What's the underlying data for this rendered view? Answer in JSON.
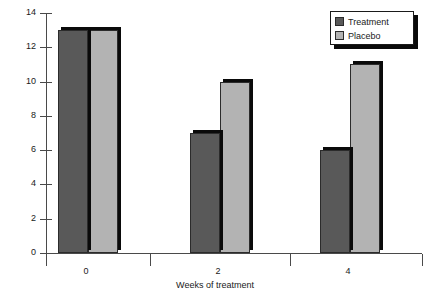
{
  "chart_data": {
    "type": "bar",
    "title": "",
    "subtitle": "",
    "xlabel": "Weeks of treatment",
    "ylabel": "",
    "categories": [
      "0",
      "2",
      "4"
    ],
    "series": [
      {
        "name": "Treatment",
        "values": [
          13,
          7,
          6
        ],
        "color": "#595959"
      },
      {
        "name": "Placebo",
        "values": [
          13,
          10,
          11
        ],
        "color": "#b3b3b3"
      }
    ],
    "ylim": [
      0,
      14
    ],
    "ytick_values": [
      0,
      2,
      4,
      6,
      8,
      10,
      12,
      14
    ],
    "ytick_labels": [
      "0",
      "2",
      "4",
      "6",
      "8",
      "10",
      "12",
      "14"
    ],
    "grid": false,
    "legend_position": "top-right",
    "legend_entries": [
      "Treatment",
      "Placebo"
    ],
    "annotations": []
  },
  "axes": {
    "y_labels": [
      "14",
      "12",
      "10",
      "8",
      "6",
      "4",
      "2",
      "0"
    ],
    "x_labels": [
      "0",
      "2",
      "4"
    ],
    "x_title": "Weeks of treatment"
  },
  "legend": {
    "items": [
      {
        "label": "Treatment",
        "color": "#595959"
      },
      {
        "label": "Placebo",
        "color": "#b3b3b3"
      }
    ]
  },
  "colors": {
    "treatment": "#595959",
    "placebo": "#b3b3b3",
    "axis": "#4a4a4a",
    "bar_outline": "#2b2b2b",
    "shadow": "#0a0a0a",
    "background": "#ffffff"
  }
}
